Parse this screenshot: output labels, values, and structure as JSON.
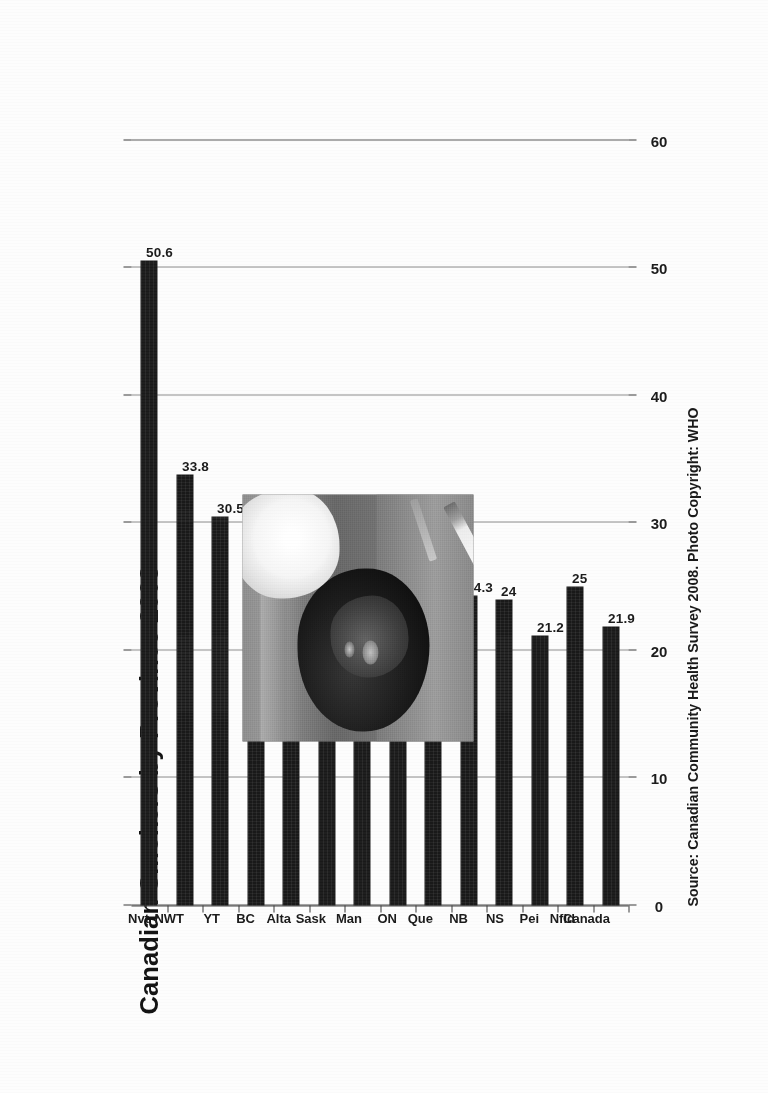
{
  "document": {
    "kind": "scanned-page",
    "orientation_note": "chart printed rotated 90 degrees counter-clockwise",
    "background_color": "#ffffff"
  },
  "chart_data": {
    "type": "bar",
    "title": "Canadian Smokers by Province 2008",
    "xlabel": "",
    "ylabel": "",
    "ylim": [
      0,
      60
    ],
    "yticks": [
      "0",
      "10",
      "20",
      "30",
      "40",
      "50",
      "60"
    ],
    "grid": true,
    "legend": "none",
    "orientation": "vertical-bars-rotated",
    "bar_color": "#191919",
    "categories": [
      "Nvt",
      "NWT",
      "YT",
      "BC",
      "Alta",
      "Sask",
      "Man",
      "ON",
      "Que",
      "NB",
      "NS",
      "Pei",
      "Nfld",
      "Canada"
    ],
    "values": [
      50.6,
      33.8,
      30.5,
      18.9,
      22.8,
      25.5,
      25.1,
      20.4,
      23.9,
      24.3,
      24,
      21.2,
      25,
      21.9
    ],
    "value_labels": [
      "50.6",
      "33.8",
      "30.5",
      "18.9",
      "22.8",
      "25.5",
      "25.1",
      "20.4",
      "23.9",
      "24.3",
      "24",
      "21.2",
      "25",
      "21.9"
    ],
    "annotations": [
      {
        "name": "source-note",
        "text": "Source: Canadian Community Health Survey 2008. Photo Copyright: WHO"
      }
    ]
  },
  "photo": {
    "caption": "",
    "alt": "grayscale photo of a person lying down smoking a cigarette",
    "copyright": "WHO"
  }
}
